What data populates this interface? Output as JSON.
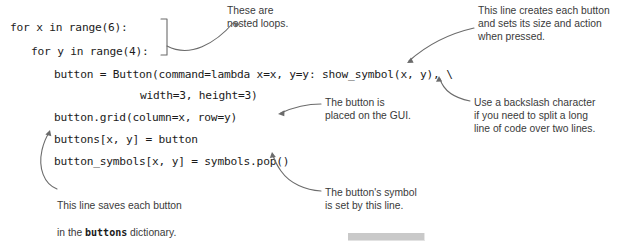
{
  "figure": {
    "kind": "annotated-code-listing",
    "language": "python",
    "background_color": "#ffffff",
    "code_color": "#1b1b1b",
    "annotation_color": "#3a3a3a",
    "leader_color": "#6b6b6b"
  },
  "code_lines": [
    {
      "id": "line-for-x",
      "text": "for x in range(6):"
    },
    {
      "id": "line-for-y",
      "text": "for y in range(4):"
    },
    {
      "id": "line-button",
      "text": "button = Button(command=lambda x=x, y=y: show_symbol(x, y), \\"
    },
    {
      "id": "line-width-height",
      "text": "width=3, height=3)"
    },
    {
      "id": "line-grid",
      "text": "button.grid(column=x, row=y)"
    },
    {
      "id": "line-buttons",
      "text": "buttons[x, y] = button"
    },
    {
      "id": "line-symbols",
      "text": "button_symbols[x, y] = symbols.pop()"
    }
  ],
  "annotations": {
    "nested_loops": {
      "id": "note-nested-loops",
      "text": "These are\nnested loops."
    },
    "creates_button": {
      "id": "note-creates-button",
      "text": "This line creates each button\nand sets its size and action\nwhen pressed."
    },
    "placed_on_gui": {
      "id": "note-placed-on-gui",
      "text": "The button is\nplaced on the GUI."
    },
    "backslash": {
      "id": "note-backslash",
      "text": "Use a backslash character\nif you need to split a long\nline of code over two lines."
    },
    "saves_button": {
      "id": "note-saves-button",
      "line1": "This line saves each button",
      "line2_pre": "in the ",
      "line2_code": "buttons",
      "line2_post": " dictionary."
    },
    "symbol_set": {
      "id": "note-symbol-set",
      "text": "The button's symbol\nis set by this line."
    }
  },
  "decorations": {
    "loop_bracket": "right-bracket-spanning-two-for-lines",
    "gray_bar": "gray-scrollbar-like-bar"
  }
}
